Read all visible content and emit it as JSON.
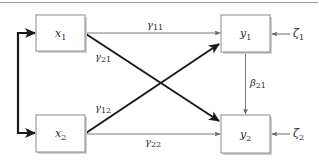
{
  "diagram": {
    "type": "path-diagram",
    "colors": {
      "background": "#ffffff",
      "box_fill": "#ffffff",
      "box_stroke": "#8a8a8a",
      "box_shadow": "#c8c8c8",
      "thin_arrow": "#7a7a7a",
      "thick_arrow": "#1a1a1a",
      "top_rule": "#9a9a9a",
      "text": "#2a2a2a"
    },
    "nodes": [
      {
        "id": "x1",
        "base": "x",
        "sub": "1",
        "role": "exogenous"
      },
      {
        "id": "x2",
        "base": "x",
        "sub": "2",
        "role": "exogenous"
      },
      {
        "id": "y1",
        "base": "y",
        "sub": "1",
        "role": "endogenous"
      },
      {
        "id": "y2",
        "base": "y",
        "sub": "2",
        "role": "endogenous"
      }
    ],
    "errors": [
      {
        "id": "zeta1",
        "base": "ζ",
        "sub": "1",
        "target": "y1"
      },
      {
        "id": "zeta2",
        "base": "ζ",
        "sub": "2",
        "target": "y2"
      }
    ],
    "paths": [
      {
        "id": "gamma11",
        "base": "γ",
        "sub": "11",
        "from": "x1",
        "to": "y1",
        "weight": "thin"
      },
      {
        "id": "gamma21",
        "base": "γ",
        "sub": "21",
        "from": "x1",
        "to": "y2",
        "weight": "thick"
      },
      {
        "id": "gamma12",
        "base": "γ",
        "sub": "12",
        "from": "x2",
        "to": "y1",
        "weight": "thick"
      },
      {
        "id": "gamma22",
        "base": "γ",
        "sub": "22",
        "from": "x2",
        "to": "y2",
        "weight": "thin"
      },
      {
        "id": "beta21",
        "base": "β",
        "sub": "21",
        "from": "y1",
        "to": "y2",
        "weight": "thin"
      }
    ],
    "covariances": [
      {
        "id": "x1-x2",
        "between": [
          "x1",
          "x2"
        ],
        "weight": "thick",
        "style": "double-headed bracket"
      }
    ]
  }
}
